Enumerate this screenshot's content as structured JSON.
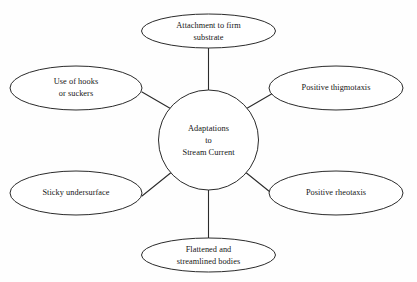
{
  "diagram": {
    "title": "Adaptations to Stream Current",
    "type": "radial-concept-map",
    "background_color": "#fefefe",
    "stroke_color": "#2b2b2b",
    "text_color": "#151515",
    "center": {
      "name": "center-node",
      "shape": "circle",
      "line1": "Adaptations",
      "line2": "to",
      "line3": "Stream Current"
    },
    "nodes": [
      {
        "id": "attachment-to-firm-substrate",
        "shape": "ellipse",
        "position": "top",
        "line1": "Attachment to firm",
        "line2": "substrate"
      },
      {
        "id": "positive-thigmotaxis",
        "shape": "ellipse",
        "position": "upper-right",
        "line1": "Positive thigmotaxis",
        "line2": ""
      },
      {
        "id": "positive-rheotaxis",
        "shape": "ellipse",
        "position": "lower-right",
        "line1": "Positive rheotaxis",
        "line2": ""
      },
      {
        "id": "flattened-and-streamlined-bodies",
        "shape": "ellipse",
        "position": "bottom",
        "line1": "Flattened and",
        "line2": "streamlined bodies"
      },
      {
        "id": "sticky-undersurface",
        "shape": "ellipse",
        "position": "lower-left",
        "line1": "Sticky undersurface",
        "line2": ""
      },
      {
        "id": "use-of-hooks-or-suckers",
        "shape": "ellipse",
        "position": "upper-left",
        "line1": "Use of hooks",
        "line2": "or suckers"
      }
    ]
  }
}
